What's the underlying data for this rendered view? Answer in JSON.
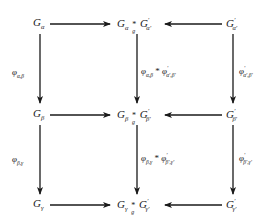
{
  "nodes": {
    "r1c1": {
      "base": "G",
      "sub": "α"
    },
    "r1c2": {
      "left": "G",
      "left_sub": "α",
      "op": "*",
      "op_sub": "g",
      "right": "G",
      "right_sup": "′",
      "right_sub": "α′"
    },
    "r1c3": {
      "base": "G",
      "sup": "′",
      "sub": "α′"
    },
    "r2c1": {
      "base": "G",
      "sub": "β"
    },
    "r2c2": {
      "left": "G",
      "left_sub": "β",
      "op": "*",
      "op_sub": "g",
      "right": "G",
      "right_sup": "′",
      "right_sub": "β′"
    },
    "r2c3": {
      "base": "G",
      "sup": "′",
      "sub": "β′"
    },
    "r3c1": {
      "base": "G",
      "sub": "γ"
    },
    "r3c2": {
      "left": "G",
      "left_sub": "γ",
      "op": "*",
      "op_sub": "g",
      "right": "G",
      "right_sup": "′",
      "right_sub": "γ′"
    },
    "r3c3": {
      "base": "G",
      "sup": "′",
      "sub": "γ′"
    }
  },
  "labels": {
    "left_top": {
      "base": "φ",
      "sub": "α,β"
    },
    "left_bottom": {
      "base": "φ",
      "sub": "β,γ"
    },
    "mid_top": {
      "a": "φ",
      "a_sub": "α,β",
      "op": "*",
      "b": "φ",
      "b_sup": "′",
      "b_sub": "α′,β′"
    },
    "mid_bottom": {
      "a": "φ",
      "a_sub": "β,γ",
      "op": "*",
      "b": "φ",
      "b_sup": "′",
      "b_sub": "β′,γ′"
    },
    "right_top": {
      "base": "φ",
      "sup": "′",
      "sub": "α′,β′"
    },
    "right_bottom": {
      "base": "φ",
      "sup": "′",
      "sub": "β′,γ′"
    }
  }
}
